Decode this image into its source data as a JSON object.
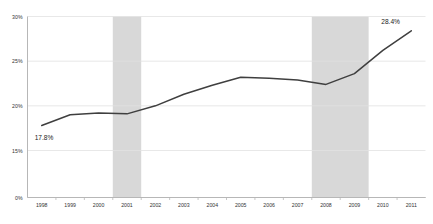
{
  "chart_data": {
    "type": "line",
    "title": "",
    "subtitle": "",
    "xlabel": "",
    "ylabel": "",
    "grid": true,
    "legend": "none",
    "categories": [
      "1998",
      "1999",
      "2000",
      "2001",
      "2002",
      "2003",
      "2004",
      "2005",
      "2006",
      "2007",
      "2008",
      "2009",
      "2010",
      "2011"
    ],
    "x": [
      1998,
      1999,
      2000,
      2001,
      2002,
      2003,
      2004,
      2005,
      2006,
      2007,
      2008,
      2009,
      2010,
      2011
    ],
    "values": [
      17.8,
      19.0,
      19.2,
      19.1,
      20.0,
      21.3,
      22.3,
      23.2,
      23.1,
      22.9,
      22.4,
      23.6,
      26.2,
      28.4
    ],
    "ylim": [
      15,
      30
    ],
    "y_axis_break": true,
    "yticks": [
      "0%",
      "15%",
      "20%",
      "25%",
      "30%"
    ],
    "ytick_values": [
      0,
      15,
      20,
      25,
      30
    ],
    "xticks": [
      "1998",
      "1999",
      "2000",
      "2001",
      "2002",
      "2003",
      "2004",
      "2005",
      "2006",
      "2007",
      "2008",
      "2009",
      "2010",
      "2011"
    ],
    "data_labels": [
      {
        "label": "17.8%",
        "x": 1998,
        "y": 17.8
      },
      {
        "label": "28.4%",
        "x": 2011,
        "y": 28.4
      }
    ],
    "shaded_bands": [
      {
        "from": 2001,
        "to": 2001,
        "label": ""
      },
      {
        "from": 2008,
        "to": 2009,
        "label": ""
      }
    ],
    "colors": {
      "line": "#3f3f3f",
      "grid": "#e2e2e2",
      "axis": "#b7b7b7",
      "band": "#d8d8d8",
      "tick_text": "#333333",
      "label_text": "#1a1a1a",
      "background": "#ffffff"
    }
  }
}
